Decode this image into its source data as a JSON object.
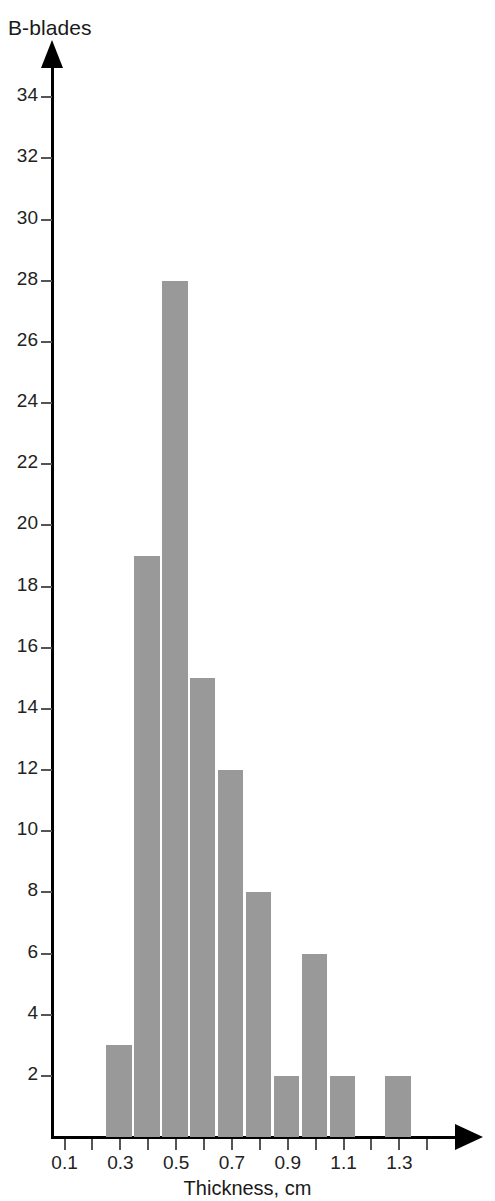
{
  "chart_data": {
    "type": "bar",
    "title": "",
    "subtitle": "",
    "xlabel": "Thickness, cm",
    "ylabel": "B-blades",
    "grid": false,
    "legend": null,
    "xlim": [
      0.05,
      1.45
    ],
    "ylim": [
      0,
      35
    ],
    "bin_width": 0.1,
    "x_tick_labels": [
      "0.1",
      "0.3",
      "0.5",
      "0.7",
      "0.9",
      "1.1",
      "1.3"
    ],
    "x_tick_values": [
      0.1,
      0.3,
      0.5,
      0.7,
      0.9,
      1.1,
      1.3
    ],
    "x_minor_tick_values": [
      0.2,
      0.4,
      0.6,
      0.8,
      1.0,
      1.2,
      1.4
    ],
    "y_tick_labels": [
      "2",
      "4",
      "6",
      "8",
      "10",
      "12",
      "14",
      "16",
      "18",
      "20",
      "22",
      "24",
      "26",
      "28",
      "30",
      "32",
      "34"
    ],
    "y_tick_values": [
      2,
      4,
      6,
      8,
      10,
      12,
      14,
      16,
      18,
      20,
      22,
      24,
      26,
      28,
      30,
      32,
      34
    ],
    "bin_edges": [
      0.25,
      0.35,
      0.45,
      0.55,
      0.65,
      0.75,
      0.85,
      0.95,
      1.05,
      1.15,
      1.25,
      1.35
    ],
    "categories": [
      "0.25-0.35",
      "0.35-0.45",
      "0.45-0.55",
      "0.55-0.65",
      "0.65-0.75",
      "0.75-0.85",
      "0.85-0.95",
      "0.95-1.05",
      "1.05-1.15",
      "1.15-1.25",
      "1.25-1.35"
    ],
    "values": [
      3,
      19,
      28,
      15,
      12,
      8,
      2,
      6,
      2,
      0,
      2
    ],
    "bar_color": "#999999",
    "axis_color": "#000000"
  },
  "axes": {
    "y_title": "B-blades",
    "x_title": "Thickness, cm"
  }
}
